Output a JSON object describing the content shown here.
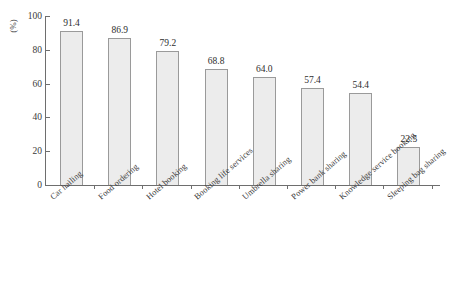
{
  "chart_data": {
    "type": "bar",
    "title": "",
    "xlabel": "",
    "ylabel": "(%)",
    "ylim": [
      0,
      100
    ],
    "yticks": [
      0,
      20,
      40,
      60,
      80,
      100
    ],
    "grid": false,
    "legend": false,
    "categories": [
      "Car hailing",
      "Food ordering",
      "Hotel booking",
      "Booking life services",
      "Umbrella sharing",
      "Power bank sharing",
      "Knowledge service booking",
      "Sleeping bag sharing"
    ],
    "values": [
      91.4,
      86.9,
      79.2,
      68.8,
      64.0,
      57.4,
      54.4,
      22.5
    ],
    "value_labels": [
      "91.4",
      "86.9",
      "79.2",
      "68.8",
      "64.0",
      "57.4",
      "54.4",
      "22.5"
    ],
    "ytick_labels": [
      "0",
      "20",
      "40",
      "60",
      "80",
      "100"
    ],
    "bar_fill_color": "#ececec",
    "bar_border_color": "#9a9a9a",
    "axis_color": "#6e6e6e",
    "text_color": "#333333"
  }
}
